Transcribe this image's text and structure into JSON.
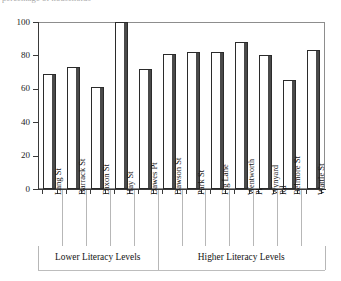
{
  "figure": {
    "top_caption": "percentage of households"
  },
  "chart_data": {
    "type": "bar",
    "title": "",
    "xlabel": "",
    "ylabel": "",
    "ylim": [
      0,
      100
    ],
    "ytick_values": [
      0,
      20,
      40,
      60,
      80,
      100
    ],
    "ytick_labels": [
      "0",
      "20",
      "40",
      "60",
      "80",
      "100"
    ],
    "grid": false,
    "legend": "none",
    "categories": [
      "Lang St",
      "Barrack St",
      "Dixon St",
      "Hay St",
      "Dawes Pt",
      "Dawson St",
      "Park St",
      "Fig Lane",
      "Wentworth Pl",
      "Wynyard Rd",
      "Belmore St",
      "Wattle St"
    ],
    "category_lines": [
      [
        "Lang St"
      ],
      [
        "Barrack St"
      ],
      [
        "Dixon St"
      ],
      [
        "Hay St"
      ],
      [
        "Dawes Pt"
      ],
      [
        "Dawson St"
      ],
      [
        "Park St"
      ],
      [
        "Fig Lane"
      ],
      [
        "Wentworth",
        "Pl"
      ],
      [
        "Wynyard",
        "Rd"
      ],
      [
        "Belmore St"
      ],
      [
        "Wattle St"
      ]
    ],
    "values": [
      69,
      73,
      61,
      100,
      72,
      81,
      82,
      82,
      88,
      80,
      65,
      83
    ],
    "groups": [
      {
        "label": "Lower Literacy Levels",
        "start_index": 0,
        "end_index": 4
      },
      {
        "label": "Higher Literacy Levels",
        "start_index": 5,
        "end_index": 11
      }
    ],
    "colors": {
      "bar_face": "#ffffff",
      "bar_edge": "#2b2b2b",
      "bar_shade": "#4a4a4a",
      "axis": "#3a3a3a",
      "frame": "#8d8d8d",
      "text": "#151515"
    }
  }
}
